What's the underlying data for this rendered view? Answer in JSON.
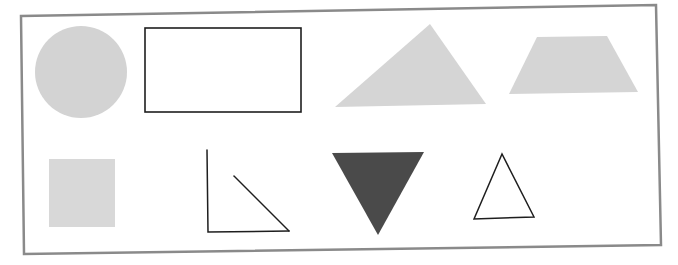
{
  "figure": {
    "colors": {
      "background": "#ffffff",
      "frame": "#8a8a8a",
      "light_fill": "#d3d3d3",
      "dark_fill": "#4a4a4a",
      "outline": "#1e1e1e"
    },
    "shapes": [
      {
        "id": "circle",
        "type": "circle",
        "fill": "light-gray",
        "row": 1,
        "position": 1
      },
      {
        "id": "rectangle",
        "type": "rectangle",
        "fill": "none",
        "outline": "black",
        "row": 1,
        "position": 2
      },
      {
        "id": "scalene-triangle",
        "type": "triangle",
        "fill": "light-gray",
        "row": 1,
        "position": 3
      },
      {
        "id": "trapezoid",
        "type": "trapezoid",
        "fill": "light-gray",
        "row": 1,
        "position": 4
      },
      {
        "id": "square",
        "type": "square",
        "fill": "light-gray",
        "row": 2,
        "position": 1
      },
      {
        "id": "open-right-angle-figure",
        "type": "open figure (not closed)",
        "fill": "none",
        "outline": "black",
        "row": 2,
        "position": 2
      },
      {
        "id": "inverted-triangle",
        "type": "triangle",
        "fill": "dark-gray",
        "row": 2,
        "position": 3
      },
      {
        "id": "outline-triangle",
        "type": "triangle",
        "fill": "none",
        "outline": "black",
        "row": 2,
        "position": 4
      }
    ]
  }
}
